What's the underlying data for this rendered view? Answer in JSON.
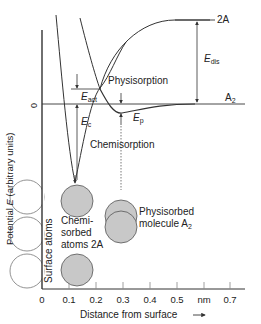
{
  "diagram": {
    "y_axis_label_prefix": "Potential ",
    "y_axis_label_var": "E",
    "y_axis_label_suffix": " (arbitrary units)",
    "y_zero_label": "0",
    "x_axis_label": "Distance from surface",
    "x_axis_arrow": "→",
    "x_ticks": [
      "0",
      "0.1",
      "0.2",
      "0.3",
      "0.4",
      "0.5",
      "nm",
      "0.7"
    ],
    "levels": {
      "dissociated": "2A",
      "molecule_main": "A",
      "molecule_sub": "2"
    },
    "energies": {
      "dis_main": "E",
      "dis_sub": "dis",
      "act_main": "E",
      "act_sub": "act",
      "c_main": "E",
      "c_sub": "c",
      "p_main": "E",
      "p_sub": "p"
    },
    "regions": {
      "physisorption": "Physisorption",
      "chemisorption": "Chemisorption"
    },
    "atoms": {
      "surface": "Surface atoms",
      "chem_line1": "Chemi-",
      "chem_line2": "sorbed",
      "chem_line3": "atoms 2A",
      "phys_line1": "Physisorbed",
      "phys_line2_main": "molecule A",
      "phys_line2_sub": "2"
    },
    "colors": {
      "line": "#333333",
      "atom_fill": "#c8c8c8",
      "surface_atom_fill": "#ffffff"
    }
  }
}
